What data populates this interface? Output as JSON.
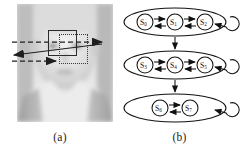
{
  "figure": {
    "panel_a": {
      "caption": "(a)",
      "image_kind": "grayscale-face-photo",
      "overlays": {
        "solid_rectangle_label": "solid search window",
        "dotted_rectangle_label": "dotted displaced window",
        "arrow_dashed_top_label": "dashed horizontal arrow right",
        "arrow_solid_diagonal_label": "solid diagonal arrow left",
        "arrow_dashed_bottom_label": "dashed horizontal arrow right"
      }
    },
    "panel_b": {
      "caption": "(b)",
      "diagram_type": "hierarchical-hmm-state-diagram",
      "groups": [
        {
          "id": "group-1",
          "states": [
            "S",
            "S",
            "S"
          ],
          "subscripts": [
            "0",
            "1",
            "2"
          ]
        },
        {
          "id": "group-2",
          "states": [
            "S",
            "S",
            "S"
          ],
          "subscripts": [
            "3",
            "4",
            "5"
          ]
        },
        {
          "id": "group-3",
          "states": [
            "S",
            "S"
          ],
          "subscripts": [
            "6",
            "7"
          ]
        }
      ],
      "group_transitions": [
        "group-1 to group-2",
        "group-2 to group-3"
      ],
      "self_loops": 3
    }
  },
  "colors": {
    "background": "#ffffff",
    "ink": "#1a1a1a",
    "stroke": "#2b2b2b",
    "face_light": "#e9e9e9",
    "face_mid": "#cfcfcf",
    "face_dark": "#a8a8a8"
  }
}
